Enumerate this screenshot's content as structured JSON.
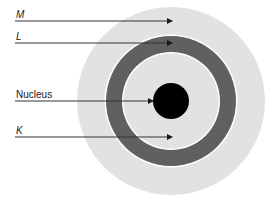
{
  "diagram": {
    "title": "",
    "center": {
      "x": 171,
      "y": 101
    },
    "shells": [
      {
        "id": "M",
        "label": "M",
        "radius_outer": 94,
        "color": "#e2e2e2"
      },
      {
        "id": "L",
        "label": "L",
        "radius_outer": 65,
        "radius_inner": 48,
        "color": "#606060"
      },
      {
        "id": "K",
        "label": "K",
        "radius_outer": 48,
        "color": "#e2e2e2"
      }
    ],
    "nucleus": {
      "label": "Nucleus",
      "radius": 18,
      "color": "#000000"
    },
    "labels": [
      {
        "text": "M",
        "italic": true,
        "y_line": 21,
        "arrow_end_x": 172
      },
      {
        "text": "L",
        "italic": true,
        "y_line": 43,
        "arrow_end_x": 172
      },
      {
        "text": "Nucleus",
        "italic": false,
        "y_line": 101,
        "arrow_end_x": 153
      },
      {
        "text": "K",
        "italic": true,
        "y_line": 137,
        "arrow_end_x": 172
      }
    ],
    "colors": {
      "outer_shell": "#e2e2e2",
      "dark_ring": "#606060",
      "gap_line": "#ffffff",
      "nucleus": "#000000",
      "leader_line": "#333333"
    }
  }
}
